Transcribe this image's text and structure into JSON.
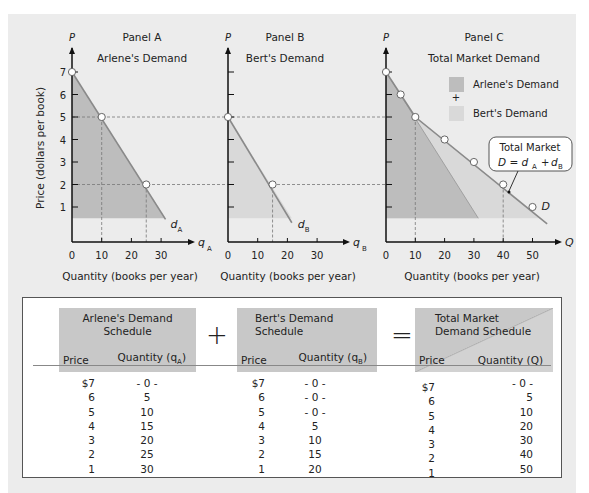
{
  "chart_data": [
    {
      "type": "area",
      "panel_label": "Panel A",
      "title": "Arlene's Demand",
      "ylabel": "Price (dollars per book)",
      "yaxis_symbol": "P",
      "xaxis_symbol": "q",
      "xaxis_subscript": "A",
      "xlabel": "Quantity (books per year)",
      "xticks": [
        0,
        10,
        20,
        30
      ],
      "yticks": [
        1,
        2,
        3,
        4,
        5,
        6,
        7
      ],
      "xlim": [
        0,
        35
      ],
      "ylim": [
        0,
        7.5
      ],
      "curve_label": "d",
      "curve_subscript": "A",
      "series": [
        {
          "name": "Arlene's Demand",
          "x": [
            0,
            5,
            10,
            15,
            20,
            25,
            30
          ],
          "y": [
            7,
            6,
            5,
            4,
            3,
            2,
            1
          ]
        }
      ],
      "highlighted_points": [
        {
          "x": 0,
          "y": 7
        },
        {
          "x": 10,
          "y": 5
        },
        {
          "x": 25,
          "y": 2
        }
      ]
    },
    {
      "type": "area",
      "panel_label": "Panel B",
      "title": "Bert's Demand",
      "yaxis_symbol": "P",
      "xaxis_symbol": "q",
      "xaxis_subscript": "B",
      "xlabel": "Quantity (books per year)",
      "xticks": [
        0,
        10,
        20,
        30
      ],
      "yticks": [
        1,
        2,
        3,
        4,
        5,
        6,
        7
      ],
      "xlim": [
        0,
        35
      ],
      "ylim": [
        0,
        7.5
      ],
      "curve_label": "d",
      "curve_subscript": "B",
      "series": [
        {
          "name": "Bert's Demand",
          "x": [
            0,
            5,
            10,
            15,
            20
          ],
          "y": [
            5,
            4,
            3,
            2,
            1
          ]
        }
      ],
      "highlighted_points": [
        {
          "x": 0,
          "y": 5
        },
        {
          "x": 15,
          "y": 2
        }
      ]
    },
    {
      "type": "area",
      "panel_label": "Panel C",
      "title": "Total Market Demand",
      "yaxis_symbol": "P",
      "xaxis_symbol": "Q",
      "xlabel": "Quantity (books per year)",
      "xticks": [
        0,
        10,
        20,
        30,
        40,
        50
      ],
      "yticks": [
        1,
        2,
        3,
        4,
        5,
        6,
        7
      ],
      "xlim": [
        0,
        55
      ],
      "ylim": [
        0,
        7.5
      ],
      "curve_label": "D",
      "legend": [
        {
          "label": "Arlene's Demand",
          "color": "#bdbdbd"
        },
        {
          "label": "Bert's Demand",
          "color": "#d9d9d9"
        }
      ],
      "legend_operator": "+",
      "legend_position": "top-right",
      "annotation": {
        "line1": "Total Market",
        "line2": "D = d_A + d_B"
      },
      "series": [
        {
          "name": "Total Market Demand",
          "x": [
            0,
            5,
            10,
            20,
            30,
            40,
            50
          ],
          "y": [
            7,
            6,
            5,
            4,
            3,
            2,
            1
          ]
        },
        {
          "name": "Arlene's Demand",
          "x": [
            0,
            30
          ],
          "y": [
            7,
            1
          ]
        }
      ],
      "highlighted_points": [
        {
          "x": 0,
          "y": 7
        },
        {
          "x": 5,
          "y": 6
        },
        {
          "x": 10,
          "y": 5
        },
        {
          "x": 20,
          "y": 4
        },
        {
          "x": 30,
          "y": 3
        },
        {
          "x": 40,
          "y": 2
        },
        {
          "x": 50,
          "y": 1
        }
      ]
    }
  ],
  "colors": {
    "arlene_fill": "#bdbdbd",
    "bert_fill": "#d9d9d9",
    "curve": "#8a8a8a",
    "background": "#ececec"
  },
  "schedules": {
    "arlene": {
      "title": "Arlene's Demand Schedule",
      "title_line1": "Arlene's Demand",
      "title_line2": "Schedule",
      "price_header": "Price",
      "qty_header": "Quantity (q",
      "qty_sub": "A",
      "qty_close": ")",
      "prices": [
        "$7",
        "6",
        "5",
        "4",
        "3",
        "2",
        "1"
      ],
      "quantities": [
        "- 0 -",
        "5",
        "10",
        "15",
        "20",
        "25",
        "30"
      ]
    },
    "operator_plus": "+",
    "bert": {
      "title_line1": "Bert's Demand",
      "title_line2": "Schedule",
      "price_header": "Price",
      "qty_header": "Quantity (q",
      "qty_sub": "B",
      "qty_close": ")",
      "prices": [
        "$7",
        "6",
        "5",
        "4",
        "3",
        "2",
        "1"
      ],
      "quantities": [
        "- 0 -",
        "- 0 -",
        "- 0 -",
        "5",
        "10",
        "15",
        "20"
      ]
    },
    "operator_equals": "=",
    "total": {
      "title_line1": "Total Market",
      "title_line2": "Demand Schedule",
      "price_header": "Price",
      "qty_header": "Quantity (Q)",
      "prices": [
        "$7",
        "6",
        "5",
        "4",
        "3",
        "2",
        "1"
      ],
      "quantities": [
        "- 0 -",
        "5",
        "10",
        "20",
        "30",
        "40",
        "50"
      ]
    }
  }
}
